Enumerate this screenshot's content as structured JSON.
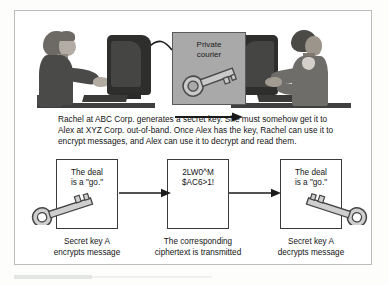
{
  "figure": {
    "frame_color": "#b9bdbe"
  },
  "scene": {
    "courier": {
      "label_line1": "Private",
      "label_line2": "courier",
      "box_color": "#a9a9a9",
      "key_icon": "key-icon"
    },
    "left_person": {
      "name": "Rachel",
      "icon": "person-at-computer-icon"
    },
    "right_person": {
      "name": "Alex",
      "icon": "person-at-computer-icon"
    },
    "direction_arrow": "arrow-right-icon"
  },
  "description": {
    "text": "Rachel at ABC Corp. generates a secret key. She must somehow get it to Alex at XYZ Corp. out-of-band. Once Alex has the key, Rachel can use it to encrypt messages, and Alex can use it to decrypt and read them."
  },
  "flow": {
    "steps": [
      {
        "id": "plaintext-source",
        "box_line1": "The deal",
        "box_line2": "is a \"go.\"",
        "caption_line1": "Secret key A",
        "caption_line2": "encrypts message",
        "key_icon": "key-icon"
      },
      {
        "id": "ciphertext",
        "box_line1": "2LW0^M",
        "box_line2": "$AC6>1!",
        "caption_line1": "The corresponding",
        "caption_line2": "ciphertext is transmitted",
        "key_icon": null
      },
      {
        "id": "plaintext-result",
        "box_line1": "The deal",
        "box_line2": "is a \"go.\"",
        "caption_line1": "Secret key A",
        "caption_line2": "decrypts message",
        "key_icon": "key-icon"
      }
    ],
    "arrows": [
      {
        "id": "arrow-encrypt",
        "icon": "arrow-right-icon"
      },
      {
        "id": "arrow-decrypt",
        "icon": "arrow-right-icon"
      }
    ]
  },
  "colors": {
    "box_border": "#3b3b3b",
    "text": "#141414",
    "key_fill": "#c9c9c9",
    "key_stroke": "#4a4a4a"
  }
}
